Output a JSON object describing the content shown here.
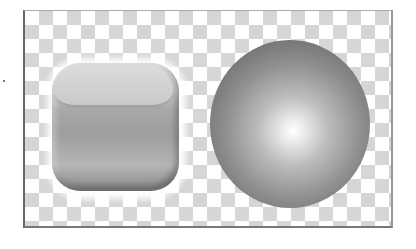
{
  "scene": {
    "description": "Two glossy grayscale shapes on a transparency checkerboard",
    "shapes": [
      {
        "name": "rounded-square-button",
        "style": "glossy"
      },
      {
        "name": "sphere",
        "style": "radial-gradient"
      }
    ],
    "colors": {
      "checker_light": "#ffffff",
      "checker_dark": "#d6d6d6",
      "frame_border": "#666666"
    }
  }
}
